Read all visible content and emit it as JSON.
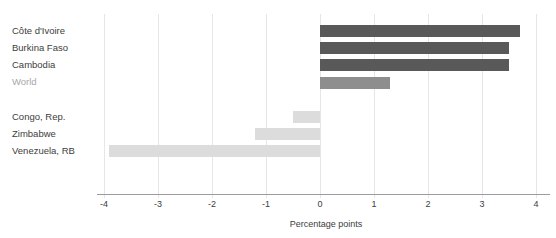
{
  "chart_data": {
    "type": "bar",
    "orientation": "horizontal",
    "xlabel": "Percentage points",
    "xlim": [
      -4,
      4
    ],
    "xticks": [
      -4,
      -3,
      -2,
      -1,
      0,
      1,
      2,
      3,
      4
    ],
    "grid": true,
    "legend": false,
    "rows": [
      {
        "label": "Côte d'Ivoire",
        "value": 3.7,
        "bar_color": "#595959",
        "label_color": "#3d3d3d"
      },
      {
        "label": "Burkina Faso",
        "value": 3.5,
        "bar_color": "#595959",
        "label_color": "#3d3d3d"
      },
      {
        "label": "Cambodia",
        "value": 3.5,
        "bar_color": "#595959",
        "label_color": "#3d3d3d"
      },
      {
        "label": "World",
        "value": 1.3,
        "bar_color": "#8e8e8e",
        "label_color": "#a8a8a8"
      },
      {
        "label": "",
        "value": null,
        "bar_color": null,
        "label_color": null
      },
      {
        "label": "Congo, Rep.",
        "value": -0.5,
        "bar_color": "#dcdcdc",
        "label_color": "#3d3d3d"
      },
      {
        "label": "Zimbabwe",
        "value": -1.2,
        "bar_color": "#dcdcdc",
        "label_color": "#3d3d3d"
      },
      {
        "label": "Venezuela, RB",
        "value": -3.9,
        "bar_color": "#dcdcdc",
        "label_color": "#3d3d3d"
      }
    ]
  },
  "colors": {
    "background": "#ffffff",
    "gridline": "#e6e6e6",
    "axis_line": "#9c9c9c",
    "tick_text": "#3d3d3d",
    "xlabel_text": "#3d3d3d"
  }
}
